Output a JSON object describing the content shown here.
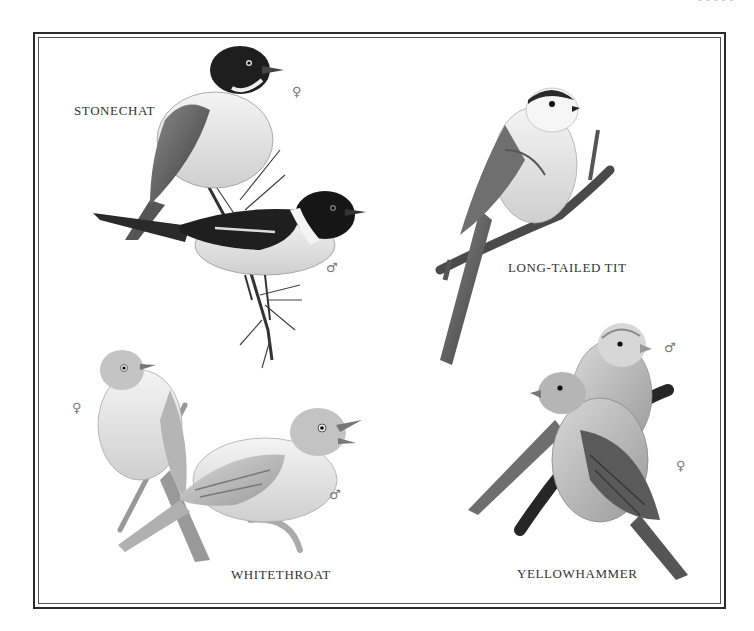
{
  "page": {
    "header_fragment": "- - - - -",
    "frame_color": "#2b2b2b",
    "background": "#ffffff"
  },
  "plates": [
    {
      "id": "stonechat",
      "label": "STONECHAT",
      "specimens": [
        {
          "sex": "female",
          "symbol": "♀"
        },
        {
          "sex": "male",
          "symbol": "♂"
        }
      ]
    },
    {
      "id": "long-tailed-tit",
      "label": "LONG-TAILED TIT",
      "specimens": []
    },
    {
      "id": "whitethroat",
      "label": "WHITETHROAT",
      "specimens": [
        {
          "sex": "female",
          "symbol": "♀"
        },
        {
          "sex": "male",
          "symbol": "♂"
        }
      ]
    },
    {
      "id": "yellowhammer",
      "label": "YELLOWHAMMER",
      "specimens": [
        {
          "sex": "male",
          "symbol": "♂"
        },
        {
          "sex": "female",
          "symbol": "♀"
        }
      ]
    }
  ]
}
